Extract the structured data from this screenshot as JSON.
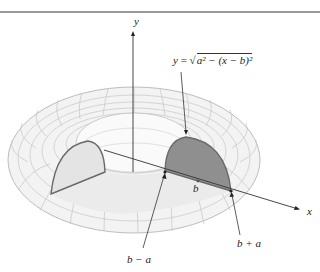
{
  "figure": {
    "type": "torus-solid-of-revolution",
    "axes": {
      "y_label": "y",
      "x_label": "x"
    },
    "equation_label": {
      "lhs": "y",
      "eq": "=",
      "radicand": "a² − (x − b)²"
    },
    "point_labels": {
      "center": "b",
      "inner": "b − a",
      "outer": "b + a"
    },
    "colors": {
      "background": "#ffffff",
      "torus_mesh": "#b8b8b8",
      "torus_fill": "#f2f2f2",
      "cut_face": "#e9e9e9",
      "shaded_semicircle": "#8f8f8f",
      "semicircle_outline": "#6a6a6a",
      "axis": "#333333",
      "top_rule": "#777777"
    }
  }
}
